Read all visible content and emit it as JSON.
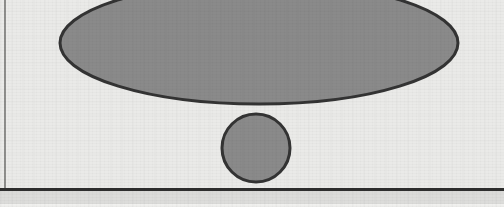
{
  "page": {
    "width": 504,
    "height": 207,
    "kind": "scanned-document-figure",
    "background_color": "#eaeae8",
    "footer_band_color": "#dcdcda",
    "footer_base_color": "#f1f1ef"
  },
  "rules": {
    "left_margin_rule": {
      "label": "left margin rule",
      "color": "#8e8e8c",
      "x": 4,
      "y": 0,
      "width": 2,
      "height": 189
    },
    "bottom_horizontal_rule": {
      "label": "bottom horizontal rule",
      "color": "#2e2e2e",
      "x": 0,
      "y": 188,
      "width": 504,
      "height": 3
    }
  },
  "figure": {
    "label": "exclamation mark glyph",
    "fill_color": "#8a8a8a",
    "stroke_color": "#333333",
    "stroke_width": 3,
    "shapes": [
      {
        "name": "ellipse-stem",
        "type": "ellipse",
        "cx": 259,
        "cy": 43,
        "rx": 199,
        "ry": 61
      },
      {
        "name": "circle-dot",
        "type": "circle",
        "cx": 256,
        "cy": 148,
        "r": 34
      }
    ]
  }
}
